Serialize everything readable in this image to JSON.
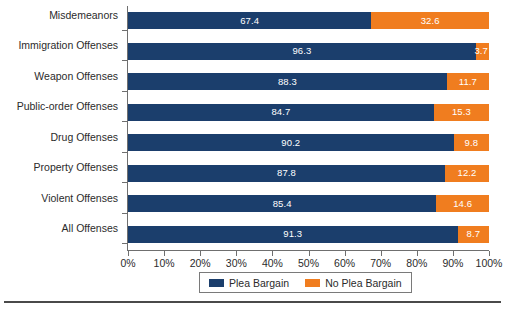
{
  "chart_data": {
    "type": "bar",
    "orientation": "horizontal",
    "stacked": true,
    "stacked_normalized": true,
    "title": "",
    "subtitle": "",
    "xlabel": "",
    "ylabel": "",
    "xlim": [
      0,
      100
    ],
    "grid": false,
    "legend_position": "bottom",
    "categories": [
      "Misdemeanors",
      "Immigration Offenses",
      "Weapon Offenses",
      "Public-order Offenses",
      "Drug Offenses",
      "Property Offenses",
      "Violent Offenses",
      "All Offenses"
    ],
    "series": [
      {
        "name": "Plea Bargain",
        "color": "#1b3e6c",
        "values": [
          67.4,
          96.3,
          88.3,
          84.7,
          90.2,
          87.8,
          85.4,
          91.3
        ],
        "labels": [
          "67.4",
          "96.3",
          "88.3",
          "84.7",
          "90.2",
          "87.8",
          "85.4",
          "91.3"
        ]
      },
      {
        "name": "No Plea Bargain",
        "color": "#f07d1f",
        "values": [
          32.6,
          3.7,
          11.7,
          15.3,
          9.8,
          12.2,
          14.6,
          8.7
        ],
        "labels": [
          "32.6",
          "3.7",
          "11.7",
          "15.3",
          "9.8",
          "12.2",
          "14.6",
          "8.7"
        ]
      }
    ],
    "xticks": [
      0,
      10,
      20,
      30,
      40,
      50,
      60,
      70,
      80,
      90,
      100
    ],
    "xticklabels": [
      "0%",
      "10%",
      "20%",
      "30%",
      "40%",
      "50%",
      "60%",
      "70%",
      "80%",
      "90%",
      "100%"
    ]
  },
  "legend": {
    "items": [
      {
        "label": "Plea Bargain",
        "swatch": "primary"
      },
      {
        "label": "No Plea Bargain",
        "swatch": "secondary"
      }
    ]
  },
  "colors": {
    "primary": "#1b3e6c",
    "secondary": "#f07d1f",
    "axis": "#6f6f6f",
    "text": "#2b2b2b",
    "rule": "#4a4a4a",
    "value_text": "#ffffff"
  }
}
